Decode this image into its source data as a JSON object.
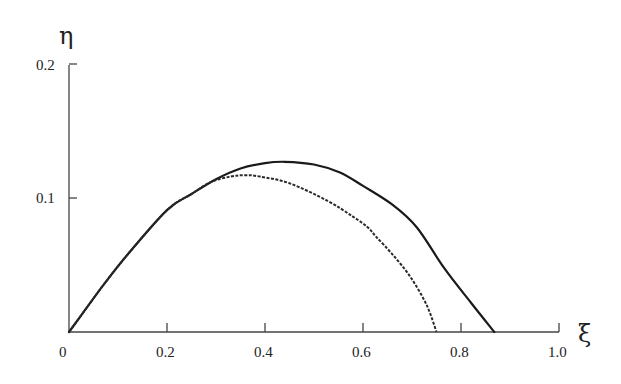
{
  "chart_data": {
    "type": "line",
    "title": "",
    "xlabel": "ξ",
    "ylabel": "η",
    "xlim": [
      0,
      1.0
    ],
    "ylim": [
      0,
      0.2
    ],
    "grid": false,
    "legend": null,
    "x_ticks": [
      "0",
      "0.2",
      "0.4",
      "0.6",
      "0.8",
      "1.0"
    ],
    "x_tick_values": [
      0,
      0.2,
      0.4,
      0.6,
      0.8,
      1.0
    ],
    "y_ticks": [
      "0.1",
      "0.2"
    ],
    "y_tick_values": [
      0.1,
      0.2
    ],
    "series": [
      {
        "name": "solid",
        "style": "solid",
        "x": [
          0,
          0.03,
          0.07,
          0.12,
          0.2,
          0.25,
          0.3,
          0.35,
          0.4,
          0.44,
          0.5,
          0.553,
          0.6,
          0.66,
          0.71,
          0.765,
          0.82,
          0.868
        ],
        "y": [
          0,
          0.015,
          0.035,
          0.058,
          0.091,
          0.103,
          0.114,
          0.122,
          0.126,
          0.127,
          0.125,
          0.119,
          0.109,
          0.095,
          0.078,
          0.048,
          0.022,
          0
        ]
      },
      {
        "name": "dashed",
        "style": "dashed",
        "x": [
          0,
          0.03,
          0.07,
          0.12,
          0.2,
          0.25,
          0.29,
          0.33,
          0.36,
          0.39,
          0.45,
          0.527,
          0.58,
          0.61,
          0.627,
          0.66,
          0.697,
          0.73,
          0.75
        ],
        "y": [
          0,
          0.015,
          0.035,
          0.058,
          0.091,
          0.103,
          0.112,
          0.116,
          0.117,
          0.116,
          0.111,
          0.098,
          0.086,
          0.078,
          0.071,
          0.058,
          0.041,
          0.02,
          0
        ]
      }
    ]
  }
}
